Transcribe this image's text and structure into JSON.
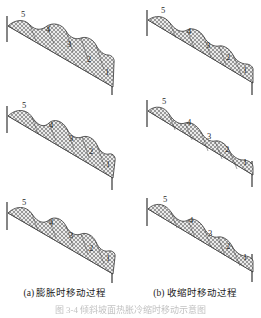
{
  "figure": {
    "panels": [
      {
        "id": "a-step-1",
        "column": "a",
        "row": 1,
        "segment_labels": [
          "1",
          "2",
          "3",
          "4",
          "5"
        ],
        "description": "slope with five hatched blocks, initial state"
      },
      {
        "id": "b-step-1",
        "column": "b",
        "row": 1,
        "segment_labels": [
          "1",
          "2",
          "3",
          "4",
          "5"
        ],
        "description": "slope with five hatched blocks, initial state"
      },
      {
        "id": "a-step-2",
        "column": "a",
        "row": 2,
        "segment_labels": [
          "1",
          "2",
          "3",
          "4",
          "5"
        ],
        "description": "slope with five hatched blocks, intermediate state"
      },
      {
        "id": "b-step-2",
        "column": "b",
        "row": 2,
        "segment_labels": [
          "1",
          "2",
          "3",
          "4",
          "5"
        ],
        "description": "slope with five hatched blocks, intermediate state"
      },
      {
        "id": "a-step-3",
        "column": "a",
        "row": 3,
        "segment_labels": [
          "1",
          "2",
          "3",
          "4",
          "5"
        ],
        "description": "slope with five hatched blocks, final state"
      },
      {
        "id": "b-step-3",
        "column": "b",
        "row": 3,
        "segment_labels": [
          "1",
          "2",
          "3",
          "4",
          "5"
        ],
        "description": "slope with five hatched blocks, final state"
      }
    ],
    "captions": {
      "a": "(a) 膨胀时移动过程",
      "b": "(b) 收缩时移动过程"
    },
    "figure_title": "图 3-4  倾斜坡面热胀冷缩时移动示意图",
    "colors": {
      "ink": "#1a1a1a",
      "hatch": "#4a4a4a",
      "fill": "#e8e8e8",
      "paper": "#ffffff"
    }
  }
}
